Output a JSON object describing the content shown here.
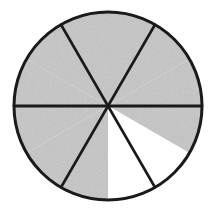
{
  "figure": {
    "title": "Circle divided into six equal sectors",
    "shape": "circle",
    "center_x": 108,
    "center_y": 106,
    "radius": 94,
    "total_sectors": 6,
    "shaded_count": 5,
    "unshaded_count": 1,
    "fraction_shaded": "5/6",
    "sector_angle_degrees": 60,
    "colors": {
      "shaded_fill": "#c6c6c6",
      "unshaded_fill": "#ffffff",
      "outline": "#1a1a1a",
      "background": "#ffffff"
    },
    "sectors": [
      {
        "id": "sector-right",
        "start_angle": -30,
        "end_angle": 30,
        "state": "shaded",
        "label": ""
      },
      {
        "id": "sector-upper-right",
        "start_angle": -90,
        "end_angle": -30,
        "state": "shaded",
        "label": ""
      },
      {
        "id": "sector-upper-left",
        "start_angle": -150,
        "end_angle": -90,
        "state": "shaded",
        "label": ""
      },
      {
        "id": "sector-left",
        "start_angle": 150,
        "end_angle": 210,
        "state": "shaded",
        "label": ""
      },
      {
        "id": "sector-lower-left",
        "start_angle": 90,
        "end_angle": 150,
        "state": "shaded",
        "label": ""
      },
      {
        "id": "sector-lower-right",
        "start_angle": 30,
        "end_angle": 90,
        "state": "unshaded",
        "label": ""
      }
    ]
  }
}
